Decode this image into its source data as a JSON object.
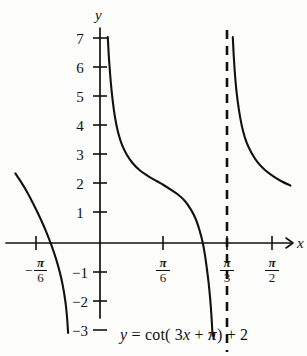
{
  "figure": {
    "title": "",
    "equation_caption": "y = cot(3x + π) + 2",
    "background_color": "#fdfdfb",
    "curve_color": "#111111"
  },
  "axes": {
    "x_axis_label": "x",
    "y_axis_label": "y",
    "x_tick_labels": [
      {
        "id": "neg-pi-over-6",
        "sign": "−",
        "numerator": "π",
        "denominator": "6",
        "value": -0.5236,
        "px": 36
      },
      {
        "id": "pi-over-6",
        "sign": "",
        "numerator": "π",
        "denominator": "6",
        "value": 0.5236,
        "px": 163
      },
      {
        "id": "pi-over-3",
        "sign": "",
        "numerator": "π",
        "denominator": "3",
        "value": 1.0472,
        "px": 227
      },
      {
        "id": "pi-over-2",
        "sign": "",
        "numerator": "π",
        "denominator": "2",
        "value": 1.5708,
        "px": 272
      }
    ],
    "y_tick_labels": [
      "7",
      "6",
      "5",
      "4",
      "3",
      "2",
      "1",
      "−1",
      "−2",
      "−3"
    ],
    "y_tick_values": [
      7,
      6,
      5,
      4,
      3,
      2,
      1,
      -1,
      -2,
      -3
    ],
    "xlim": [
      -0.6981,
      1.7453
    ],
    "ylim": [
      -3.4,
      7.6
    ],
    "grid": false
  },
  "chart_data": {
    "type": "line",
    "title": "",
    "subtitle": "",
    "xlabel": "x",
    "ylabel": "y",
    "equation": "y = cot(3x + π) + 2",
    "function": "cot(3x + pi) + 2",
    "period": 1.0472,
    "vertical_shift": 2,
    "horizontal_compression": 3,
    "phase_shift": -1.0472,
    "xlim": [
      -0.6981,
      1.7453
    ],
    "ylim": [
      -3.4,
      7.6
    ],
    "grid": false,
    "legend": "none",
    "asymptotes": [
      {
        "x": 0.0,
        "drawn": false
      },
      {
        "x": 1.0472,
        "drawn": true,
        "style": "dashed",
        "label": "π/3"
      }
    ],
    "x_intercepts": [
      -0.2618,
      0.7854
    ],
    "annotations": [
      {
        "text": "y = cot(3x + π) + 2",
        "x": 0.95,
        "y": -3.9,
        "role": "equation-caption"
      }
    ],
    "series": [
      {
        "name": "branch-left",
        "x_domain": [
          -0.6981,
          -0.1
        ],
        "points": [
          {
            "x": -0.6981,
            "y": 2.4
          },
          {
            "x": -0.65,
            "y": 2.1
          },
          {
            "x": -0.6,
            "y": 1.75
          },
          {
            "x": -0.55,
            "y": 1.35
          },
          {
            "x": -0.5236,
            "y": 1.13
          },
          {
            "x": -0.48,
            "y": 0.74
          },
          {
            "x": -0.44,
            "y": 0.35
          },
          {
            "x": -0.4,
            "y": -0.08
          },
          {
            "x": -0.36,
            "y": -0.58
          },
          {
            "x": -0.33,
            "y": -1.03
          },
          {
            "x": -0.31,
            "y": -1.4
          },
          {
            "x": -0.295,
            "y": -1.75
          },
          {
            "x": -0.283,
            "y": -2.1
          },
          {
            "x": -0.273,
            "y": -2.5
          },
          {
            "x": -0.266,
            "y": -2.9
          },
          {
            "x": -0.263,
            "y": -3.1
          }
        ]
      },
      {
        "name": "branch-middle",
        "x_domain": [
          0.0,
          1.0472
        ],
        "points": [
          {
            "x": 0.064,
            "y": 7.1
          },
          {
            "x": 0.075,
            "y": 6.3
          },
          {
            "x": 0.09,
            "y": 5.5
          },
          {
            "x": 0.105,
            "y": 4.9
          },
          {
            "x": 0.125,
            "y": 4.3
          },
          {
            "x": 0.15,
            "y": 3.8
          },
          {
            "x": 0.18,
            "y": 3.4
          },
          {
            "x": 0.22,
            "y": 3.05
          },
          {
            "x": 0.27,
            "y": 2.75
          },
          {
            "x": 0.33,
            "y": 2.5
          },
          {
            "x": 0.4,
            "y": 2.3
          },
          {
            "x": 0.47,
            "y": 2.13
          },
          {
            "x": 0.5236,
            "y": 2.0
          },
          {
            "x": 0.58,
            "y": 1.85
          },
          {
            "x": 0.64,
            "y": 1.68
          },
          {
            "x": 0.7,
            "y": 1.45
          },
          {
            "x": 0.75,
            "y": 1.15
          },
          {
            "x": 0.79,
            "y": 0.82
          },
          {
            "x": 0.82,
            "y": 0.45
          },
          {
            "x": 0.845,
            "y": 0.05
          },
          {
            "x": 0.865,
            "y": -0.4
          },
          {
            "x": 0.88,
            "y": -0.85
          },
          {
            "x": 0.895,
            "y": -1.35
          },
          {
            "x": 0.908,
            "y": -1.9
          },
          {
            "x": 0.918,
            "y": -2.45
          },
          {
            "x": 0.925,
            "y": -2.95
          },
          {
            "x": 0.929,
            "y": -3.2
          }
        ]
      },
      {
        "name": "branch-right",
        "x_domain": [
          1.0472,
          1.5708
        ],
        "points": [
          {
            "x": 1.095,
            "y": 7.1
          },
          {
            "x": 1.105,
            "y": 6.3
          },
          {
            "x": 1.118,
            "y": 5.55
          },
          {
            "x": 1.135,
            "y": 4.9
          },
          {
            "x": 1.155,
            "y": 4.35
          },
          {
            "x": 1.18,
            "y": 3.85
          },
          {
            "x": 1.21,
            "y": 3.45
          },
          {
            "x": 1.25,
            "y": 3.1
          },
          {
            "x": 1.3,
            "y": 2.78
          },
          {
            "x": 1.36,
            "y": 2.52
          },
          {
            "x": 1.43,
            "y": 2.3
          },
          {
            "x": 1.5,
            "y": 2.12
          },
          {
            "x": 1.5708,
            "y": 1.98
          }
        ]
      }
    ]
  }
}
